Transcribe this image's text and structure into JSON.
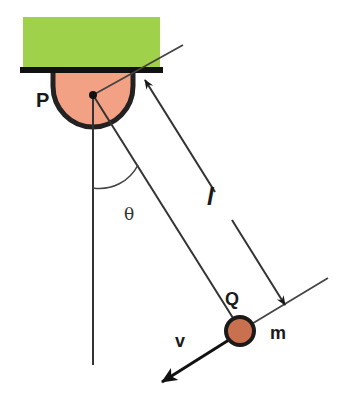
{
  "diagram": {
    "labels": {
      "pivot": "P",
      "bob": "Q",
      "mass": "m",
      "length": "l",
      "angle": "θ",
      "velocity": "v"
    },
    "colors": {
      "support_block": "#9fd24a",
      "ceiling_bar": "#111111",
      "pivot_fill": "#f3a184",
      "pivot_outline": "#222222",
      "bob_fill": "#c9714f",
      "bob_outline": "#1a1a1a",
      "line": "#333333"
    }
  }
}
